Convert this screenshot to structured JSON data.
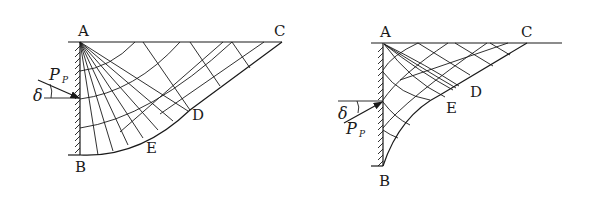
{
  "diagrams": [
    {
      "id": "left",
      "description": "Passive earth pressure slip-line field, force inclined downward",
      "labels": {
        "A": "A",
        "B": "B",
        "C": "C",
        "D": "D",
        "E": "E",
        "force": "P",
        "force_sub": "P",
        "angle": "δ"
      }
    },
    {
      "id": "right",
      "description": "Passive earth pressure slip-line field, force inclined upward",
      "labels": {
        "A": "A",
        "B": "B",
        "C": "C",
        "D": "D",
        "E": "E",
        "force": "P",
        "force_sub": "P",
        "angle": "δ"
      }
    }
  ],
  "colors": {
    "ink": "#1a1a1a",
    "background": "#ffffff"
  }
}
